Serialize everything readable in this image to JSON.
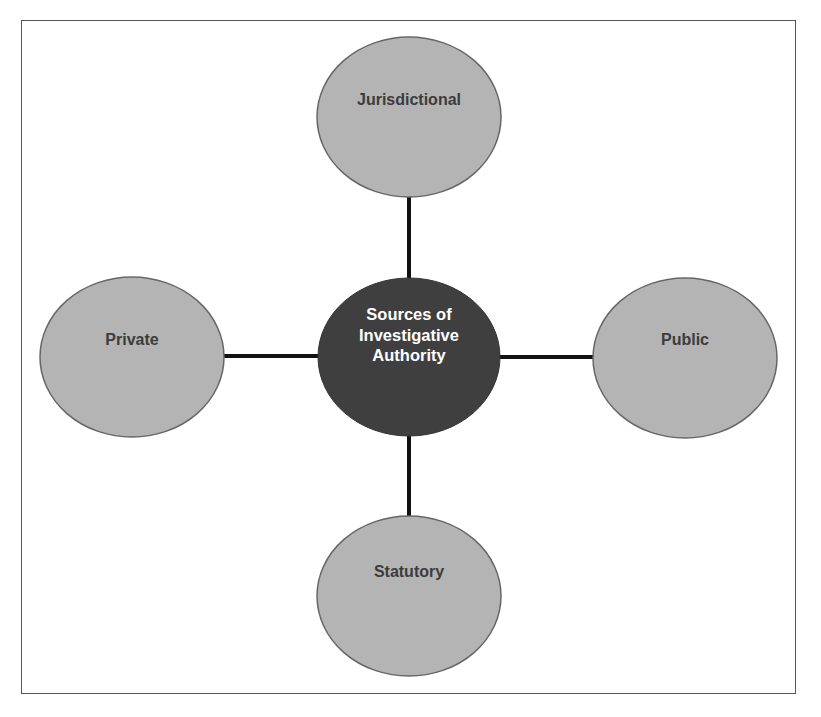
{
  "diagram": {
    "type": "hub-and-spoke",
    "colors": {
      "outer_fill": "#b4b4b4",
      "outer_stroke": "#666666",
      "center_fill": "#3f3f3f",
      "center_text": "#ffffff",
      "outer_text": "#3c3c3c",
      "connector": "#111111",
      "frame": "#555555"
    },
    "center": {
      "id": "sources-of-investigative-authority",
      "label_lines": [
        "Sources of",
        "Investigative",
        "Authority"
      ]
    },
    "nodes": [
      {
        "id": "jurisdictional",
        "label": "Jurisdictional",
        "position": "top"
      },
      {
        "id": "private",
        "label": "Private",
        "position": "left"
      },
      {
        "id": "public",
        "label": "Public",
        "position": "right"
      },
      {
        "id": "statutory",
        "label": "Statutory",
        "position": "bottom"
      }
    ],
    "edges": [
      {
        "from": "sources-of-investigative-authority",
        "to": "jurisdictional"
      },
      {
        "from": "sources-of-investigative-authority",
        "to": "private"
      },
      {
        "from": "sources-of-investigative-authority",
        "to": "public"
      },
      {
        "from": "sources-of-investigative-authority",
        "to": "statutory"
      }
    ]
  }
}
